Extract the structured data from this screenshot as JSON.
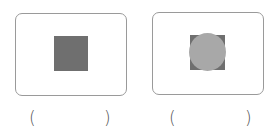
{
  "panels": [
    {
      "label_open": "(",
      "label_close": ")",
      "shapes": [
        "square"
      ]
    },
    {
      "label_open": "(",
      "label_close": ")",
      "shapes": [
        "square",
        "circle"
      ]
    }
  ],
  "colors": {
    "frame": "#9a9a9a",
    "square": "#6f6f6f",
    "circle": "#a8a8a8"
  }
}
